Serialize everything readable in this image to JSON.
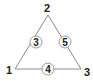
{
  "diagram": {
    "type": "labeled-triangle",
    "vertices": [
      {
        "label": "1",
        "position": "bottom-left"
      },
      {
        "label": "2",
        "position": "top"
      },
      {
        "label": "3",
        "position": "bottom-right"
      }
    ],
    "edges": [
      {
        "between": [
          "2",
          "1"
        ],
        "circle_label": "3",
        "side": "left"
      },
      {
        "between": [
          "2",
          "3"
        ],
        "circle_label": "5",
        "side": "right"
      },
      {
        "between": [
          "1",
          "3"
        ],
        "circle_label": "4",
        "side": "bottom"
      }
    ],
    "colors": {
      "line": "#8a8a8a",
      "circle_stroke": "#9a9a9a",
      "circle_fill": "#ffffff",
      "text": "#222222"
    }
  }
}
